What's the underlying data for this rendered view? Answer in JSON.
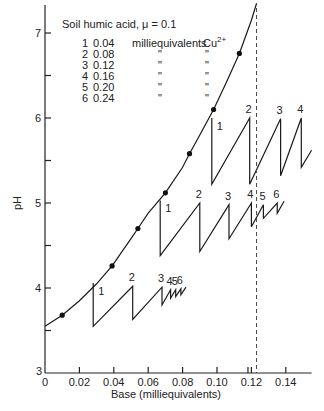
{
  "chart_data": {
    "type": "line",
    "title": "Soil humic acid, μ = 0.1",
    "xlabel": "Base (milliequivalents)",
    "ylabel": "pH",
    "xlim": [
      0,
      0.155
    ],
    "ylim": [
      3,
      7.4
    ],
    "xticks": [
      0,
      0.02,
      0.04,
      0.06,
      0.08,
      0.1,
      0.12,
      0.14
    ],
    "xtick_labels": [
      "0",
      "0.02",
      "0.04",
      "0.06",
      "0.08",
      "0.10",
      "0.12",
      "0.14"
    ],
    "yticks": [
      3,
      4,
      5,
      6,
      7
    ],
    "ytick_labels": [
      "3",
      "4",
      "5",
      "6",
      "7"
    ],
    "legend": {
      "placement": "top-left",
      "header": "Soil humic acid, μ = 0.1",
      "entries": [
        {
          "id": "1",
          "value": "0.04",
          "unit": "milliequivalents",
          "ion": "Cu2+"
        },
        {
          "id": "2",
          "value": "0.08",
          "unit": "\"",
          "ion": "\""
        },
        {
          "id": "3",
          "value": "0.12",
          "unit": "\"",
          "ion": "\""
        },
        {
          "id": "4",
          "value": "0.16",
          "unit": "\"",
          "ion": "\""
        },
        {
          "id": "5",
          "value": "0.20",
          "unit": "\"",
          "ion": "\""
        },
        {
          "id": "6",
          "value": "0.24",
          "unit": "\"",
          "ion": "\""
        }
      ]
    },
    "main_curve": {
      "name": "Titration curve (no Cu)",
      "x": [
        0.0,
        0.01,
        0.02,
        0.03,
        0.039,
        0.05,
        0.054,
        0.06,
        0.07,
        0.08,
        0.084,
        0.09,
        0.098,
        0.105,
        0.113,
        0.12,
        0.123
      ],
      "y": [
        3.55,
        3.68,
        3.85,
        4.05,
        4.26,
        4.58,
        4.7,
        4.88,
        5.12,
        5.42,
        5.58,
        5.8,
        6.1,
        6.4,
        6.76,
        7.15,
        7.35
      ],
      "markers_x": [
        0.01,
        0.039,
        0.054,
        0.07,
        0.084,
        0.098,
        0.113
      ],
      "markers_y": [
        3.68,
        4.26,
        4.7,
        5.12,
        5.58,
        6.1,
        6.76
      ]
    },
    "series": [
      {
        "name": "Tier starting pH ~4",
        "points": [
          [
            0.028,
            4.06
          ],
          [
            0.028,
            3.55
          ],
          [
            0.051,
            4.02
          ],
          [
            0.051,
            3.63
          ],
          [
            0.068,
            4.01
          ],
          [
            0.068,
            3.8
          ],
          [
            0.073,
            3.98
          ],
          [
            0.073,
            3.88
          ],
          [
            0.076,
            3.98
          ],
          [
            0.076,
            3.9
          ],
          [
            0.079,
            3.99
          ],
          [
            0.079,
            3.92
          ],
          [
            0.082,
            4.01
          ]
        ],
        "labels": [
          {
            "text": "1",
            "x": 0.028,
            "y": 4.06
          },
          {
            "text": "2",
            "x": 0.051,
            "y": 4.02
          },
          {
            "text": "3",
            "x": 0.068,
            "y": 4.01
          },
          {
            "text": "4",
            "x": 0.073,
            "y": 3.98
          },
          {
            "text": "5",
            "x": 0.076,
            "y": 3.98
          },
          {
            "text": "6",
            "x": 0.079,
            "y": 3.99
          }
        ]
      },
      {
        "name": "Tier starting pH ~5",
        "points": [
          [
            0.067,
            5.03
          ],
          [
            0.067,
            4.38
          ],
          [
            0.09,
            5.0
          ],
          [
            0.09,
            4.43
          ],
          [
            0.107,
            4.98
          ],
          [
            0.107,
            4.58
          ],
          [
            0.12,
            5.0
          ],
          [
            0.12,
            4.72
          ],
          [
            0.127,
            4.98
          ],
          [
            0.127,
            4.82
          ],
          [
            0.135,
            5.0
          ],
          [
            0.135,
            4.88
          ],
          [
            0.139,
            5.02
          ]
        ],
        "labels": [
          {
            "text": "1",
            "x": 0.067,
            "y": 5.03
          },
          {
            "text": "2",
            "x": 0.09,
            "y": 5.0
          },
          {
            "text": "3",
            "x": 0.107,
            "y": 4.98
          },
          {
            "text": "4",
            "x": 0.12,
            "y": 5.0
          },
          {
            "text": "5",
            "x": 0.127,
            "y": 4.98
          },
          {
            "text": "6",
            "x": 0.135,
            "y": 5.0
          }
        ]
      },
      {
        "name": "Tier starting pH ~6",
        "points": [
          [
            0.097,
            6.0
          ],
          [
            0.097,
            5.22
          ],
          [
            0.119,
            6.0
          ],
          [
            0.119,
            5.22
          ],
          [
            0.137,
            5.99
          ],
          [
            0.137,
            5.32
          ],
          [
            0.149,
            6.0
          ],
          [
            0.149,
            5.42
          ],
          [
            0.155,
            5.62
          ]
        ],
        "labels": [
          {
            "text": "1",
            "x": 0.097,
            "y": 6.0
          },
          {
            "text": "2",
            "x": 0.119,
            "y": 6.0
          },
          {
            "text": "3",
            "x": 0.137,
            "y": 5.99
          },
          {
            "text": "4",
            "x": 0.149,
            "y": 6.0
          }
        ]
      }
    ],
    "reference_line": {
      "style": "dashed",
      "orientation": "vertical",
      "x": 0.123
    }
  }
}
